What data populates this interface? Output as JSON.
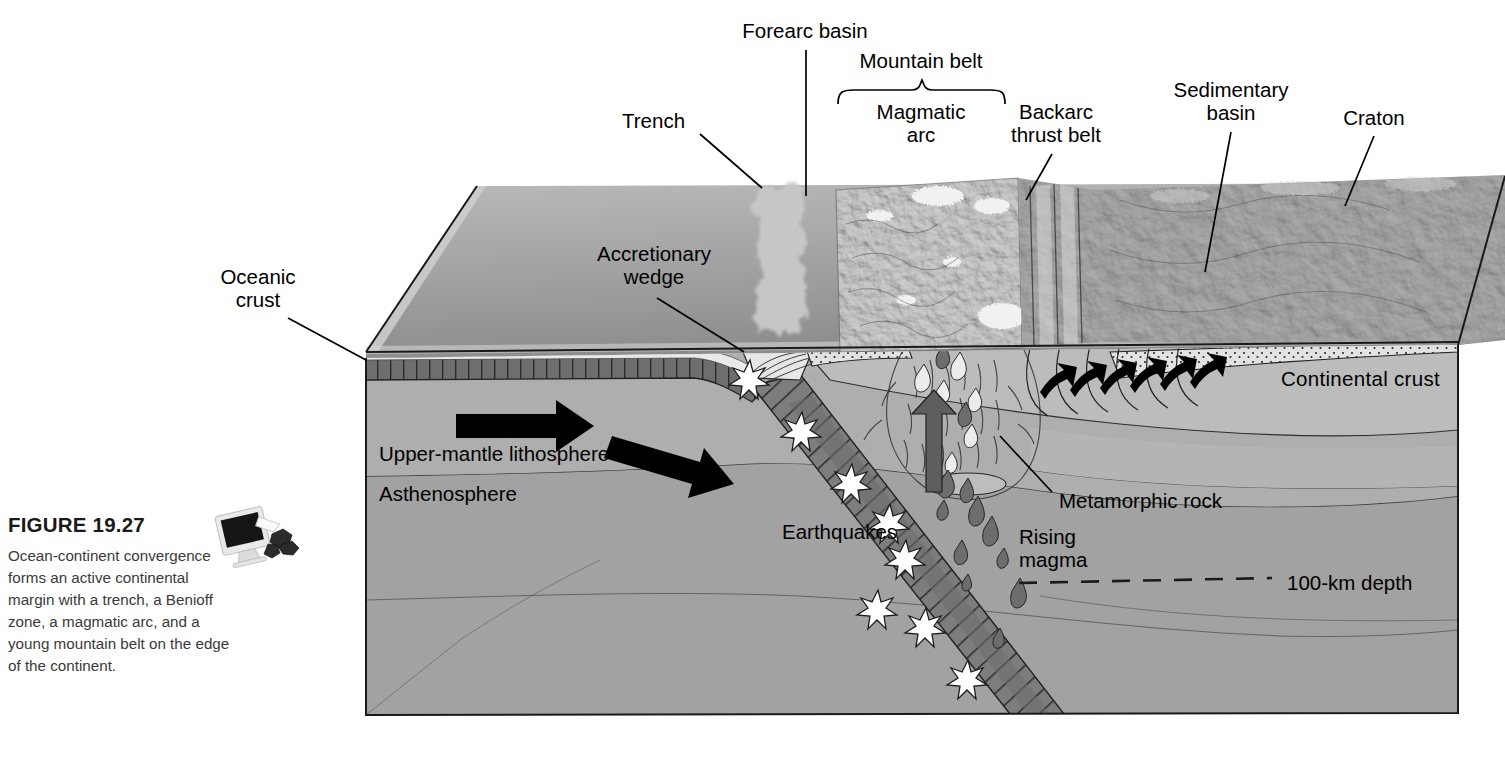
{
  "figure": {
    "number_label": "FIGURE 19.27",
    "caption": "Ocean-continent convergence forms an active continental margin with a trench, a Benioff zone, a magmatic arc, and a young mountain belt on the edge of the continent.",
    "icon_name": "computer-monitor-with-rock-samples-icon"
  },
  "diagram": {
    "type": "geological-block-diagram",
    "surface_labels": [
      {
        "id": "trench",
        "text": "Trench",
        "x": 693,
        "y": 122,
        "align": "r",
        "leader": [
          [
            700,
            132
          ],
          [
            760,
            186
          ]
        ]
      },
      {
        "id": "forearc-basin",
        "text": "Forearc basin",
        "x": 805,
        "y": 30,
        "align": "center",
        "leader": [
          [
            806,
            48
          ],
          [
            806,
            195
          ]
        ]
      },
      {
        "id": "mountain-belt",
        "text": "Mountain belt",
        "x": 921,
        "y": 60,
        "align": "center",
        "leader": null
      },
      {
        "id": "magmatic-arc",
        "text": "Magmatic\narc",
        "x": 921,
        "y": 110,
        "align": "center",
        "leader": null
      },
      {
        "id": "backarc-thrust",
        "text": "Backarc\nthrust belt",
        "x": 1056,
        "y": 110,
        "align": "center",
        "leader": [
          [
            1050,
            152
          ],
          [
            1024,
            198
          ]
        ]
      },
      {
        "id": "sedimentary-basin",
        "text": "Sedimentary\nbasin",
        "x": 1231,
        "y": 88,
        "align": "center",
        "leader": [
          [
            1231,
            130
          ],
          [
            1204,
            272
          ]
        ]
      },
      {
        "id": "craton",
        "text": "Craton",
        "x": 1374,
        "y": 117,
        "align": "center",
        "leader": [
          [
            1374,
            134
          ],
          [
            1345,
            205
          ]
        ]
      },
      {
        "id": "oceanic-crust",
        "text": "Oceanic\ncrust",
        "x": 258,
        "y": 276,
        "align": "center",
        "leader": [
          [
            285,
            318
          ],
          [
            366,
            358
          ]
        ]
      },
      {
        "id": "accretionary-wedge",
        "text": "Accretionary\nwedge",
        "x": 654,
        "y": 253,
        "align": "center",
        "leader": [
          [
            655,
            296
          ],
          [
            742,
            351
          ]
        ]
      }
    ],
    "section_labels": [
      {
        "id": "continental-crust",
        "text": "Continental crust",
        "x": 1281,
        "y": 378,
        "align": "left"
      },
      {
        "id": "upper-mantle-lithosphere",
        "text": "Upper-mantle lithosphere",
        "x": 379,
        "y": 453,
        "align": "left"
      },
      {
        "id": "asthenosphere",
        "text": "Asthenosphere",
        "x": 379,
        "y": 493,
        "align": "left"
      },
      {
        "id": "earthquakes",
        "text": "Earthquakes",
        "x": 782,
        "y": 531,
        "align": "left"
      },
      {
        "id": "metamorphic-rock",
        "text": "Metamorphic rock",
        "x": 1059,
        "y": 500,
        "align": "left"
      },
      {
        "id": "rising-magma",
        "text": "Rising\nmagma",
        "x": 1019,
        "y": 536,
        "align": "left"
      },
      {
        "id": "depth-marker",
        "text": "100-km depth",
        "x": 1287,
        "y": 582,
        "align": "left"
      }
    ],
    "features": {
      "motion_arrows": 2,
      "magma_rise_arrow": 1,
      "earthquake_stars": 8,
      "thrust_fault_arrows": 6,
      "magma_droplets": 22,
      "depth_dash_line": true
    },
    "colors": {
      "ocean_surface": "#8f8f8f",
      "ocean_surface_light": "#b4b4b4",
      "continental_crust": "#b9b9b9",
      "upper_mantle": "#a8a8a8",
      "asthenosphere": "#9e9e9e",
      "subducting_slab": "#7b7b7b",
      "oceanic_crust_band": "#6e6e6e",
      "sediment_dots": "#dedede",
      "outline": "#1a1a1a",
      "arrow_black": "#000000",
      "magma_dark": "#6a6a6a",
      "star_white": "#ffffff"
    }
  }
}
